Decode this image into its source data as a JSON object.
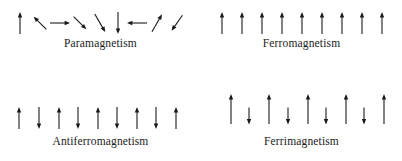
{
  "figure": {
    "background_color": "#ffffff",
    "arrow_color": "#1a1a1a",
    "width": 402,
    "height": 161
  },
  "panels": [
    {
      "id": "paramagnetism",
      "label": "Paramagnetism",
      "description": "Randomly oriented magnetic moments",
      "arrow_count": 9,
      "arrows": [
        {
          "index": 1,
          "direction": "up",
          "angle_deg": 0,
          "length": 22,
          "x": 20
        },
        {
          "index": 2,
          "direction": "up-left",
          "angle_deg": -45,
          "length": 18,
          "x": 40
        },
        {
          "index": 3,
          "direction": "right",
          "angle_deg": 90,
          "length": 20,
          "x": 60
        },
        {
          "index": 4,
          "direction": "down-right",
          "angle_deg": 135,
          "length": 18,
          "x": 80
        },
        {
          "index": 5,
          "direction": "down-right",
          "angle_deg": 150,
          "length": 21,
          "x": 100
        },
        {
          "index": 6,
          "direction": "down",
          "angle_deg": 180,
          "length": 22,
          "x": 118
        },
        {
          "index": 7,
          "direction": "left",
          "angle_deg": 270,
          "length": 20,
          "x": 137
        },
        {
          "index": 8,
          "direction": "up-right",
          "angle_deg": 30,
          "length": 20,
          "x": 157
        },
        {
          "index": 9,
          "direction": "down-left",
          "angle_deg": 215,
          "length": 19,
          "x": 177
        }
      ]
    },
    {
      "id": "ferromagnetism",
      "label": "Ferromagnetism",
      "description": "All magnetic moments aligned parallel",
      "arrow_count": 9,
      "arrows": [
        {
          "index": 1,
          "direction": "up",
          "angle_deg": 0,
          "length": 22,
          "x": 21
        },
        {
          "index": 2,
          "direction": "up",
          "angle_deg": 0,
          "length": 22,
          "x": 41
        },
        {
          "index": 3,
          "direction": "up",
          "angle_deg": 0,
          "length": 22,
          "x": 61
        },
        {
          "index": 4,
          "direction": "up",
          "angle_deg": 0,
          "length": 22,
          "x": 81
        },
        {
          "index": 5,
          "direction": "up",
          "angle_deg": 0,
          "length": 22,
          "x": 101
        },
        {
          "index": 6,
          "direction": "up",
          "angle_deg": 0,
          "length": 22,
          "x": 121
        },
        {
          "index": 7,
          "direction": "up",
          "angle_deg": 0,
          "length": 22,
          "x": 141
        },
        {
          "index": 8,
          "direction": "up",
          "angle_deg": 0,
          "length": 22,
          "x": 161
        },
        {
          "index": 9,
          "direction": "up",
          "angle_deg": 0,
          "length": 22,
          "x": 181
        }
      ]
    },
    {
      "id": "antiferromagnetism",
      "label": "Antiferromagnetism",
      "description": "Alternating equal and opposite magnetic moments",
      "arrow_count": 9,
      "arrows": [
        {
          "index": 1,
          "direction": "up",
          "angle_deg": 0,
          "length": 22,
          "x": 19
        },
        {
          "index": 2,
          "direction": "down",
          "angle_deg": 180,
          "length": 22,
          "x": 39
        },
        {
          "index": 3,
          "direction": "up",
          "angle_deg": 0,
          "length": 22,
          "x": 59
        },
        {
          "index": 4,
          "direction": "down",
          "angle_deg": 180,
          "length": 22,
          "x": 78
        },
        {
          "index": 5,
          "direction": "up",
          "angle_deg": 0,
          "length": 22,
          "x": 98
        },
        {
          "index": 6,
          "direction": "down",
          "angle_deg": 180,
          "length": 22,
          "x": 117
        },
        {
          "index": 7,
          "direction": "up",
          "angle_deg": 0,
          "length": 22,
          "x": 137
        },
        {
          "index": 8,
          "direction": "down",
          "angle_deg": 180,
          "length": 22,
          "x": 156
        },
        {
          "index": 9,
          "direction": "up",
          "angle_deg": 0,
          "length": 22,
          "x": 176
        }
      ]
    },
    {
      "id": "ferrimagnetism",
      "label": "Ferrimagnetism",
      "description": "Alternating unequal and opposite magnetic moments",
      "arrow_count": 9,
      "arrows": [
        {
          "index": 1,
          "direction": "up",
          "angle_deg": 0,
          "length": 30,
          "x": 30
        },
        {
          "index": 2,
          "direction": "down",
          "angle_deg": 180,
          "length": 17,
          "x": 48
        },
        {
          "index": 3,
          "direction": "up",
          "angle_deg": 0,
          "length": 30,
          "x": 68
        },
        {
          "index": 4,
          "direction": "down",
          "angle_deg": 180,
          "length": 17,
          "x": 87
        },
        {
          "index": 5,
          "direction": "up",
          "angle_deg": 0,
          "length": 30,
          "x": 107
        },
        {
          "index": 6,
          "direction": "down",
          "angle_deg": 180,
          "length": 17,
          "x": 125
        },
        {
          "index": 7,
          "direction": "up",
          "angle_deg": 0,
          "length": 30,
          "x": 145
        },
        {
          "index": 8,
          "direction": "down",
          "angle_deg": 180,
          "length": 17,
          "x": 163
        },
        {
          "index": 9,
          "direction": "up",
          "angle_deg": 0,
          "length": 30,
          "x": 183
        }
      ]
    }
  ]
}
